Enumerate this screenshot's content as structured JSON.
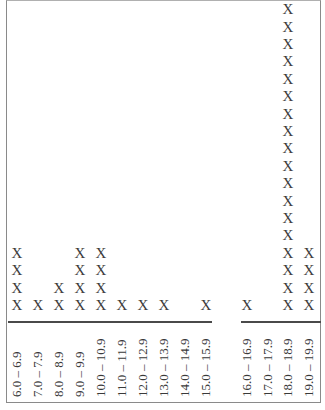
{
  "chart_data": {
    "type": "dot_plot",
    "title": "",
    "xlabel": "",
    "ylabel": "",
    "marker": "X",
    "grid": false,
    "axis_break": {
      "between": [
        "15.0 – 15.9",
        "16.0 – 16.9"
      ]
    },
    "categories": [
      "6.0 – 6.9",
      "7.0 – 7.9",
      "8.0 – 8.9",
      "9.0 – 9.9",
      "10.0 – 10.9",
      "11.0 – 11.9",
      "12.0 – 12.9",
      "13.0 – 13.9",
      "14.0 – 14.9",
      "15.0 – 15.9",
      "16.0 – 16.9",
      "17.0 – 17.9",
      "18.0 – 18.9",
      "19.0 – 19.9"
    ],
    "values": [
      4,
      1,
      2,
      4,
      4,
      1,
      1,
      1,
      0,
      1,
      1,
      0,
      18,
      4
    ]
  }
}
